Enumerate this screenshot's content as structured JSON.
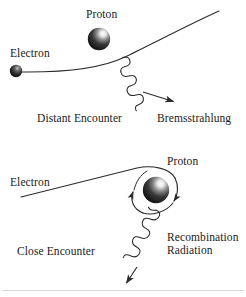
{
  "figure": {
    "background_color": "#ffffff",
    "stroke_color": "#2b2b2b",
    "text_color": "#1a1a1a",
    "width": 246,
    "height": 297
  },
  "panels": [
    {
      "id": "distant-encounter",
      "caption": "Distant Encounter",
      "particles": [
        {
          "name": "Electron",
          "label": "Electron",
          "kind": "electron",
          "cx": 16,
          "cy": 71,
          "r": 6
        },
        {
          "name": "Proton",
          "label": "Proton",
          "kind": "proton",
          "cx": 99,
          "cy": 39,
          "r": 11
        }
      ],
      "emission": {
        "label": "Bremsstrahlung",
        "kind": "photon-wave"
      },
      "trajectory": "deflected-curve"
    },
    {
      "id": "close-encounter",
      "caption": "Close Encounter",
      "particles": [
        {
          "name": "Electron",
          "label": "Electron",
          "kind": "electron",
          "cx": 16,
          "cy": 199,
          "r": 6
        },
        {
          "name": "Proton",
          "label": "Proton",
          "kind": "proton",
          "cx": 156,
          "cy": 190,
          "r": 13
        }
      ],
      "emission": {
        "label_line1": "Recombination",
        "label_line2": "Radiation",
        "kind": "photon-wave"
      },
      "trajectory": "capture-loop"
    }
  ],
  "labels": {
    "top_proton": "Proton",
    "top_electron": "Electron",
    "top_caption": "Distant Encounter",
    "top_emission": "Bremsstrahlung",
    "bottom_proton": "Proton",
    "bottom_electron": "Electron",
    "bottom_caption": "Close Encounter",
    "bottom_emission_line1": "Recombination",
    "bottom_emission_line2": "Radiation"
  },
  "colors": {
    "background": "#ffffff",
    "line": "#2b2b2b",
    "text": "#1a1a1a",
    "sphere_dark": "#1b1b1b",
    "sphere_mid": "#555555",
    "sphere_highlight": "#f2f2f2",
    "divider": "#d8d8d8"
  }
}
